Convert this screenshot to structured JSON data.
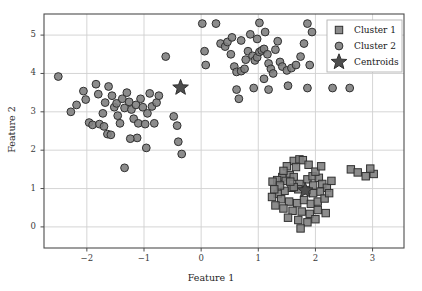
{
  "chart_data": {
    "type": "scatter",
    "title": "",
    "xlabel": "Feature 1",
    "ylabel": "Feature 2",
    "xlim": [
      -2.75,
      3.55
    ],
    "ylim": [
      -0.55,
      5.55
    ],
    "xticks": [
      -2,
      -1,
      0,
      1,
      2,
      3
    ],
    "xticklabels": [
      "−2",
      "−1",
      "0",
      "1",
      "2",
      "3"
    ],
    "yticks": [
      0,
      1,
      2,
      3,
      4,
      5
    ],
    "yticklabels": [
      "0",
      "1",
      "2",
      "3",
      "4",
      "5"
    ],
    "grid": true,
    "legend_position": "upper right",
    "series": [
      {
        "name": "Cluster 1",
        "marker": "square",
        "color": "#808080",
        "edgecolor": "#303030",
        "points": [
          [
            1.62,
            1.72
          ],
          [
            1.72,
            1.76
          ],
          [
            1.78,
            1.74
          ],
          [
            1.5,
            1.58
          ],
          [
            1.66,
            1.56
          ],
          [
            1.88,
            1.62
          ],
          [
            1.55,
            1.35
          ],
          [
            1.42,
            1.3
          ],
          [
            1.33,
            1.22
          ],
          [
            1.25,
            1.18
          ],
          [
            1.48,
            1.2
          ],
          [
            1.62,
            1.3
          ],
          [
            1.72,
            1.12
          ],
          [
            1.86,
            1.24
          ],
          [
            1.95,
            1.32
          ],
          [
            2.06,
            1.28
          ],
          [
            2.12,
            1.12
          ],
          [
            2.2,
            1.02
          ],
          [
            2.08,
            0.92
          ],
          [
            1.96,
            0.88
          ],
          [
            1.84,
            0.96
          ],
          [
            1.7,
            0.98
          ],
          [
            1.58,
            1.02
          ],
          [
            1.46,
            0.94
          ],
          [
            1.34,
            0.86
          ],
          [
            1.24,
            0.78
          ],
          [
            1.4,
            0.72
          ],
          [
            1.54,
            0.66
          ],
          [
            1.68,
            0.62
          ],
          [
            1.8,
            0.7
          ],
          [
            1.92,
            0.6
          ],
          [
            2.04,
            0.66
          ],
          [
            2.16,
            0.74
          ],
          [
            2.24,
            0.88
          ],
          [
            1.3,
            0.56
          ],
          [
            1.44,
            0.48
          ],
          [
            1.6,
            0.42
          ],
          [
            1.76,
            0.4
          ],
          [
            1.9,
            0.34
          ],
          [
            2.04,
            0.44
          ],
          [
            2.18,
            0.36
          ],
          [
            1.52,
            0.24
          ],
          [
            1.7,
            0.18
          ],
          [
            1.86,
            0.12
          ],
          [
            2.0,
            0.2
          ],
          [
            1.74,
            -0.04
          ],
          [
            1.62,
            1.04
          ],
          [
            1.38,
            1.08
          ],
          [
            2.28,
            1.2
          ],
          [
            1.28,
            0.98
          ],
          [
            2.62,
            1.5
          ],
          [
            2.74,
            1.42
          ],
          [
            2.88,
            1.32
          ],
          [
            3.02,
            1.38
          ],
          [
            2.96,
            1.52
          ],
          [
            1.44,
            1.46
          ],
          [
            1.56,
            1.18
          ],
          [
            2.0,
            1.44
          ],
          [
            2.1,
            1.58
          ],
          [
            1.96,
            1.08
          ]
        ]
      },
      {
        "name": "Cluster 2",
        "marker": "circle",
        "color": "#808080",
        "edgecolor": "#303030",
        "points": [
          [
            -2.5,
            3.92
          ],
          [
            -2.28,
            3.0
          ],
          [
            -2.18,
            3.18
          ],
          [
            -2.06,
            3.54
          ],
          [
            -2.02,
            3.32
          ],
          [
            -1.96,
            2.72
          ],
          [
            -1.9,
            2.66
          ],
          [
            -1.84,
            3.72
          ],
          [
            -1.8,
            3.46
          ],
          [
            -1.78,
            2.68
          ],
          [
            -1.72,
            2.96
          ],
          [
            -1.68,
            3.24
          ],
          [
            -1.7,
            2.62
          ],
          [
            -1.64,
            2.42
          ],
          [
            -1.58,
            2.4
          ],
          [
            -1.62,
            3.66
          ],
          [
            -1.56,
            3.42
          ],
          [
            -1.52,
            3.12
          ],
          [
            -1.48,
            3.22
          ],
          [
            -1.46,
            2.9
          ],
          [
            -1.42,
            2.7
          ],
          [
            -1.38,
            3.34
          ],
          [
            -1.34,
            3.1
          ],
          [
            -1.3,
            3.5
          ],
          [
            -1.26,
            3.26
          ],
          [
            -1.22,
            3.06
          ],
          [
            -1.18,
            2.82
          ],
          [
            -1.14,
            3.18
          ],
          [
            -1.1,
            2.7
          ],
          [
            -1.06,
            3.34
          ],
          [
            -1.02,
            3.12
          ],
          [
            -0.98,
            2.68
          ],
          [
            -0.94,
            2.96
          ],
          [
            -1.12,
            2.32
          ],
          [
            -0.9,
            3.48
          ],
          [
            -0.86,
            3.14
          ],
          [
            -0.82,
            2.7
          ],
          [
            -0.78,
            3.24
          ],
          [
            -0.74,
            3.42
          ],
          [
            -1.34,
            1.54
          ],
          [
            -1.24,
            2.3
          ],
          [
            -0.96,
            2.06
          ],
          [
            -0.48,
            2.88
          ],
          [
            -0.42,
            2.64
          ],
          [
            -0.4,
            2.22
          ],
          [
            -0.62,
            4.44
          ],
          [
            -0.34,
            1.9
          ],
          [
            0.02,
            5.3
          ],
          [
            0.26,
            5.3
          ],
          [
            0.06,
            4.58
          ],
          [
            0.08,
            4.22
          ],
          [
            0.34,
            4.78
          ],
          [
            0.42,
            4.7
          ],
          [
            0.46,
            4.82
          ],
          [
            0.52,
            4.5
          ],
          [
            0.58,
            4.18
          ],
          [
            0.62,
            4.04
          ],
          [
            0.7,
            4.06
          ],
          [
            0.76,
            4.12
          ],
          [
            0.78,
            4.36
          ],
          [
            0.82,
            4.58
          ],
          [
            0.86,
            5.02
          ],
          [
            0.9,
            4.46
          ],
          [
            0.94,
            4.34
          ],
          [
            0.98,
            4.42
          ],
          [
            1.02,
            4.56
          ],
          [
            1.06,
            4.6
          ],
          [
            1.1,
            4.64
          ],
          [
            1.02,
            5.32
          ],
          [
            1.12,
            5.08
          ],
          [
            1.16,
            4.5
          ],
          [
            1.18,
            4.26
          ],
          [
            1.22,
            4.12
          ],
          [
            1.26,
            4.0
          ],
          [
            1.3,
            4.62
          ],
          [
            1.34,
            4.84
          ],
          [
            1.38,
            4.3
          ],
          [
            1.42,
            4.18
          ],
          [
            1.5,
            4.08
          ],
          [
            1.58,
            4.14
          ],
          [
            1.66,
            4.22
          ],
          [
            1.74,
            4.44
          ],
          [
            1.8,
            4.78
          ],
          [
            1.86,
            5.3
          ],
          [
            1.94,
            5.08
          ],
          [
            1.9,
            4.22
          ],
          [
            1.52,
            3.68
          ],
          [
            1.86,
            3.62
          ],
          [
            2.3,
            3.62
          ],
          [
            2.6,
            3.62
          ],
          [
            0.62,
            3.58
          ],
          [
            0.66,
            3.34
          ],
          [
            0.92,
            3.62
          ],
          [
            1.18,
            3.58
          ],
          [
            0.54,
            4.94
          ],
          [
            0.98,
            4.9
          ],
          [
            1.1,
            3.86
          ],
          [
            0.7,
            4.86
          ]
        ]
      },
      {
        "name": "Centroids",
        "marker": "star",
        "color": "#4d4d4d",
        "edgecolor": "#303030",
        "points": [
          [
            -0.36,
            3.63
          ],
          [
            1.82,
            0.95
          ]
        ]
      }
    ]
  },
  "legend": {
    "entries": [
      {
        "label": "Cluster 1",
        "marker": "square"
      },
      {
        "label": "Cluster 2",
        "marker": "circle"
      },
      {
        "label": "Centroids",
        "marker": "star"
      }
    ]
  }
}
